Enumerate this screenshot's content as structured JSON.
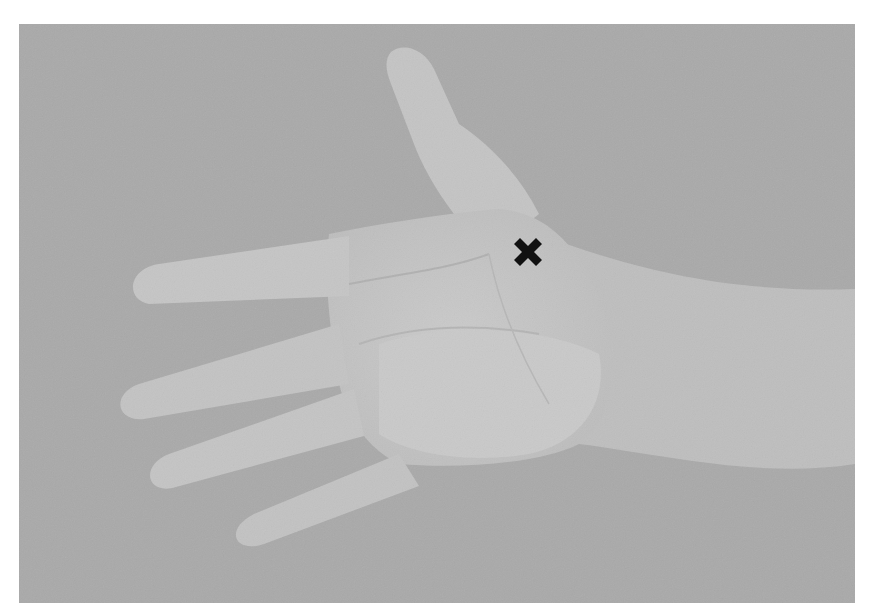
{
  "image": {
    "description": "Grayscale photo of an open left hand, palm facing viewer, fingers pointing left, thumb pointing up, on a gray textured background",
    "subject": "open palm",
    "background_color": "#a9a9a9",
    "skin_color": "#c6c6c6"
  },
  "marker": {
    "shape": "x-mark",
    "glyph": "✖",
    "color": "#111111",
    "position": {
      "x": 527,
      "y": 253
    },
    "label": "marked point on palm below index finger base, near thumb web"
  }
}
